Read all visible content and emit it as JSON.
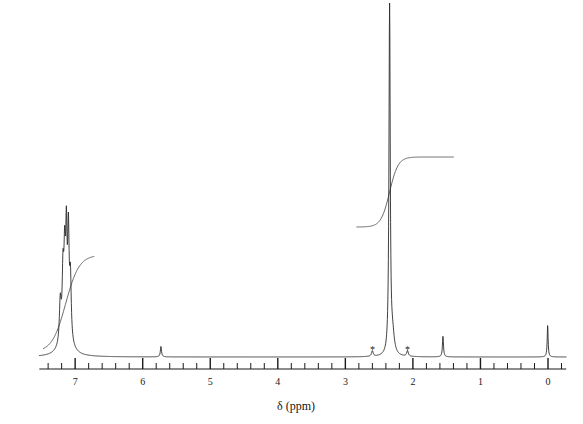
{
  "figure": {
    "type": "nmr-spectrum",
    "width": 583,
    "height": 424,
    "background_color": "#ffffff",
    "trace_color": "#2b2b2b",
    "integral_color": "#55555a"
  },
  "axis": {
    "title": "δ (ppm)",
    "orientation": "horizontal-reversed",
    "baseline_y": 357,
    "axis_line_y": 369,
    "left_ppm": 7.53,
    "right_ppm": -0.27,
    "px_per_ppm": 67.55,
    "zero_ppm_x": 548,
    "tick_labels": [
      "7",
      "6",
      "5",
      "4",
      "3",
      "2",
      "1",
      "0"
    ],
    "tick_label_values": [
      7,
      6,
      5,
      4,
      3,
      2,
      1,
      0
    ],
    "minor_tick_step_ppm": 0.2,
    "major_tick_step_ppm": 1.0
  },
  "markers": {
    "asterisk_glyph": "*",
    "asterisk_ppm": [
      2.6,
      2.08
    ],
    "asterisk_note": "spinning sidebands / impurity peaks"
  },
  "chart_data": {
    "type": "line",
    "title": "",
    "subtitle": "",
    "xlabel": "δ (ppm)",
    "ylabel": "",
    "xlim": [
      7.53,
      -0.27
    ],
    "ylim": [
      0,
      1
    ],
    "grid": false,
    "legend": "none",
    "x_axis_reversed": true,
    "tick_labels": [
      "7",
      "6",
      "5",
      "4",
      "3",
      "2",
      "1",
      "0"
    ],
    "peaks": [
      {
        "label": "aromatic-1",
        "ppm": 7.22,
        "rel_height": 0.115,
        "width_ppm": 0.016,
        "multiplicity": "m"
      },
      {
        "label": "aromatic-2",
        "ppm": 7.18,
        "rel_height": 0.175,
        "width_ppm": 0.014,
        "multiplicity": "m"
      },
      {
        "label": "aromatic-3",
        "ppm": 7.155,
        "rel_height": 0.205,
        "width_ppm": 0.013,
        "multiplicity": "m"
      },
      {
        "label": "aromatic-4",
        "ppm": 7.13,
        "rel_height": 0.26,
        "width_ppm": 0.012,
        "multiplicity": "m"
      },
      {
        "label": "aromatic-5",
        "ppm": 7.1,
        "rel_height": 0.28,
        "width_ppm": 0.013,
        "multiplicity": "m"
      },
      {
        "label": "aromatic-6",
        "ppm": 7.07,
        "rel_height": 0.17,
        "width_ppm": 0.014,
        "multiplicity": "m"
      },
      {
        "label": "aromatic-broad",
        "ppm": 7.14,
        "rel_height": 0.055,
        "width_ppm": 0.085,
        "multiplicity": "br"
      },
      {
        "label": "residual-5.7",
        "ppm": 5.73,
        "rel_height": 0.03,
        "width_ppm": 0.01,
        "multiplicity": "s"
      },
      {
        "label": "sideband-left",
        "ppm": 2.6,
        "rel_height": 0.016,
        "width_ppm": 0.014,
        "multiplicity": "s"
      },
      {
        "label": "methyl-singlet",
        "ppm": 2.345,
        "rel_height": 1.0,
        "width_ppm": 0.011,
        "multiplicity": "s"
      },
      {
        "label": "methyl-shoulder",
        "ppm": 2.3,
        "rel_height": 0.052,
        "width_ppm": 0.03,
        "multiplicity": "s"
      },
      {
        "label": "sideband-right",
        "ppm": 2.08,
        "rel_height": 0.016,
        "width_ppm": 0.014,
        "multiplicity": "s"
      },
      {
        "label": "water",
        "ppm": 1.555,
        "rel_height": 0.06,
        "width_ppm": 0.009,
        "multiplicity": "s"
      },
      {
        "label": "tms",
        "ppm": 0.005,
        "rel_height": 0.09,
        "width_ppm": 0.008,
        "multiplicity": "s"
      }
    ],
    "integrals": [
      {
        "label": "aromatic-integral",
        "start_ppm": 7.47,
        "end_ppm": 6.72,
        "rise_center_ppm": 7.14,
        "rise_width_ppm": 0.22,
        "baseline_y": 352,
        "plateau_y": 255
      },
      {
        "label": "methyl-integral",
        "start_ppm": 2.83,
        "end_ppm": 1.4,
        "rise_center_ppm": 2.345,
        "rise_width_ppm": 0.14,
        "baseline_y": 227,
        "plateau_y": 157
      }
    ]
  }
}
